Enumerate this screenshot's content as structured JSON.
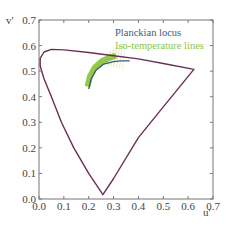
{
  "chart_data": {
    "type": "line",
    "title": "",
    "xlabel": "u'",
    "ylabel": "v'",
    "xlim": [
      0.0,
      0.7
    ],
    "ylim": [
      0.0,
      0.7
    ],
    "x_ticks": [
      "0.0",
      "0.1",
      "0.2",
      "0.3",
      "0.4",
      "0.5",
      "0.6",
      "0.7"
    ],
    "y_ticks": [
      "0.0",
      "0.1",
      "0.2",
      "0.3",
      "0.4",
      "0.5",
      "0.6",
      "0.7"
    ],
    "grid": false,
    "legend_position": "upper right (inside)",
    "series": [
      {
        "name": "Spectral locus",
        "color": "#6b2f54",
        "points": [
          [
            0.257,
            0.017
          ],
          [
            0.2,
            0.1
          ],
          [
            0.14,
            0.2
          ],
          [
            0.09,
            0.3
          ],
          [
            0.05,
            0.4
          ],
          [
            0.02,
            0.47
          ],
          [
            0.005,
            0.52
          ],
          [
            0.005,
            0.55
          ],
          [
            0.02,
            0.575
          ],
          [
            0.05,
            0.585
          ],
          [
            0.1,
            0.583
          ],
          [
            0.2,
            0.573
          ],
          [
            0.3,
            0.56
          ],
          [
            0.4,
            0.548
          ],
          [
            0.5,
            0.53
          ],
          [
            0.623,
            0.507
          ],
          [
            0.5,
            0.36
          ],
          [
            0.4,
            0.24
          ],
          [
            0.3,
            0.08
          ],
          [
            0.257,
            0.017
          ]
        ]
      },
      {
        "name": "Planckian locus",
        "color": "#3b5a78",
        "points": [
          [
            0.2,
            0.43
          ],
          [
            0.21,
            0.47
          ],
          [
            0.23,
            0.505
          ],
          [
            0.26,
            0.527
          ],
          [
            0.3,
            0.537
          ],
          [
            0.33,
            0.54
          ],
          [
            0.365,
            0.54
          ]
        ]
      },
      {
        "name": "Iso-temperature lines",
        "color": "#8dc63f",
        "points": [
          [
            0.195,
            0.44
          ],
          [
            0.205,
            0.48
          ],
          [
            0.225,
            0.515
          ],
          [
            0.255,
            0.54
          ],
          [
            0.29,
            0.555
          ],
          [
            0.31,
            0.56
          ]
        ]
      }
    ]
  },
  "legend": {
    "items": [
      {
        "label": "Planckian locus",
        "color": "#3d5d7d"
      },
      {
        "label": "Iso-temperature lines",
        "color": "#8dc63f"
      }
    ]
  },
  "axes": {
    "xlabel": "u'",
    "ylabel": "v'"
  }
}
